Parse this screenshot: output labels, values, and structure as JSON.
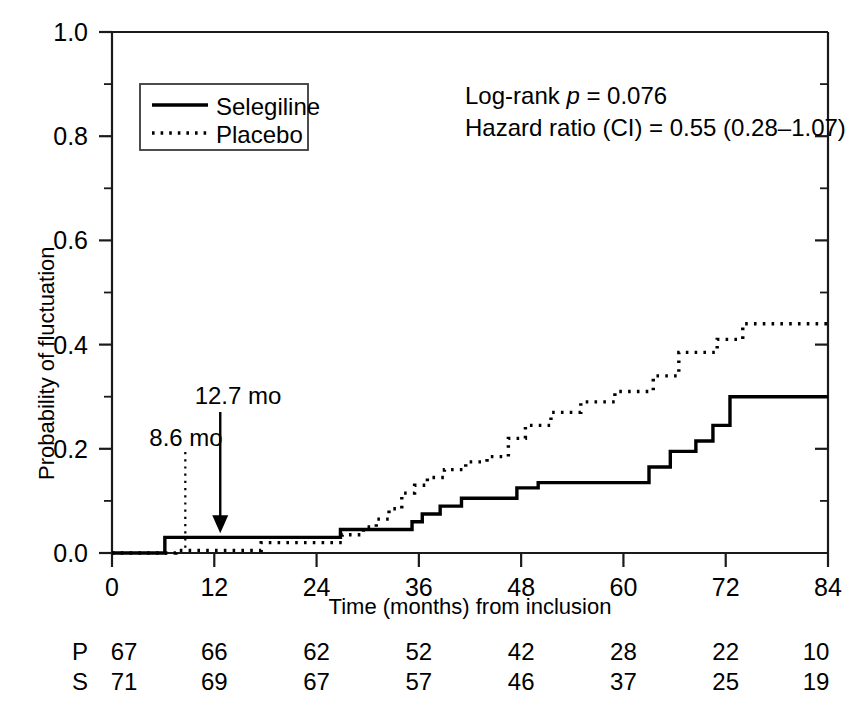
{
  "chart_data": {
    "type": "line",
    "title": "",
    "xlabel": "Time (months) from inclusion",
    "ylabel": "Probability of fluctuation",
    "xlim": [
      0,
      84
    ],
    "ylim": [
      0.0,
      1.0
    ],
    "xticks": [
      0,
      12,
      24,
      36,
      48,
      60,
      72,
      84
    ],
    "xtick_labels": [
      "0",
      "12",
      "24",
      "36",
      "48",
      "60",
      "72",
      "84"
    ],
    "yticks": [
      0.0,
      0.2,
      0.4,
      0.6,
      0.8,
      1.0
    ],
    "ytick_labels": [
      "0.0",
      "0.2",
      "0.4",
      "0.6",
      "0.8",
      "1.0"
    ],
    "yticks_minor": [
      0.1,
      0.3,
      0.5,
      0.7,
      0.9
    ],
    "grid": false,
    "legend_position": "upper-left-inside",
    "series": [
      {
        "name": "Selegiline",
        "style": "solid",
        "step": "post",
        "x": [
          0,
          5.5,
          6.2,
          25.5,
          26.8,
          28.0,
          31.5,
          34.0,
          35.2,
          36.4,
          38.5,
          41.0,
          43.5,
          47.5,
          50.0,
          61.5,
          63.0,
          65.5,
          68.5,
          70.5,
          72.5,
          84
        ],
        "y": [
          0.0,
          0.0,
          0.03,
          0.03,
          0.045,
          0.045,
          0.045,
          0.045,
          0.06,
          0.075,
          0.09,
          0.105,
          0.105,
          0.125,
          0.135,
          0.135,
          0.165,
          0.195,
          0.215,
          0.245,
          0.3,
          0.3
        ]
      },
      {
        "name": "Placebo",
        "style": "dotted",
        "step": "post",
        "x": [
          0,
          7.5,
          17.5,
          25.5,
          27.0,
          29.5,
          31.0,
          32.5,
          34.0,
          35.5,
          37.0,
          39.0,
          41.5,
          44.0,
          46.5,
          48.5,
          51.5,
          55.0,
          59.0,
          63.5,
          66.5,
          71.0,
          74.0,
          84
        ],
        "y": [
          0.0,
          0.005,
          0.02,
          0.02,
          0.035,
          0.05,
          0.065,
          0.085,
          0.115,
          0.13,
          0.145,
          0.16,
          0.175,
          0.185,
          0.22,
          0.245,
          0.27,
          0.29,
          0.31,
          0.34,
          0.385,
          0.41,
          0.44,
          0.44
        ]
      }
    ],
    "annotations": [
      {
        "text": "8.6 mo",
        "x": 8.6,
        "series": "Placebo",
        "arrow_style": "dotted"
      },
      {
        "text": "12.7 mo",
        "x": 12.7,
        "series": "Selegiline",
        "arrow_style": "solid-arrow"
      }
    ],
    "statistics": [
      {
        "text": "Log-rank p = 0.076",
        "prefix": "Log-rank ",
        "italic": "p",
        "suffix": " = 0.076"
      },
      {
        "text": "Hazard ratio (CI) = 0.55 (0.28–1.07)",
        "prefix": "Hazard ratio (CI) = 0.55 (0.28–1.07)",
        "italic": "",
        "suffix": ""
      }
    ],
    "risk_table": {
      "time_points": [
        0,
        12,
        24,
        36,
        48,
        60,
        72,
        84
      ],
      "rows": [
        {
          "label": "P",
          "name": "Placebo",
          "values": [
            "67",
            "66",
            "62",
            "52",
            "42",
            "28",
            "22",
            "10"
          ]
        },
        {
          "label": "S",
          "name": "Selegiline",
          "values": [
            "71",
            "69",
            "67",
            "57",
            "46",
            "37",
            "25",
            "19"
          ]
        }
      ]
    },
    "colors": {
      "axis": "#1a1a1a",
      "selegiline": "#000000",
      "placebo": "#000000",
      "background": "#ffffff"
    }
  },
  "legend": {
    "items": [
      {
        "label": "Selegiline",
        "style": "solid"
      },
      {
        "label": "Placebo",
        "style": "dotted"
      }
    ]
  },
  "stats_text": {
    "line1_prefix": "Log-rank ",
    "line1_italic": "p",
    "line1_suffix": " = 0.076",
    "line2": "Hazard ratio (CI) = 0.55 (0.28–1.07)"
  },
  "annotation_labels": {
    "placebo_median": "8.6 mo",
    "selegiline_median": "12.7 mo"
  },
  "axis_titles": {
    "x": "Time (months) from inclusion",
    "y": "Probability of fluctuation"
  }
}
